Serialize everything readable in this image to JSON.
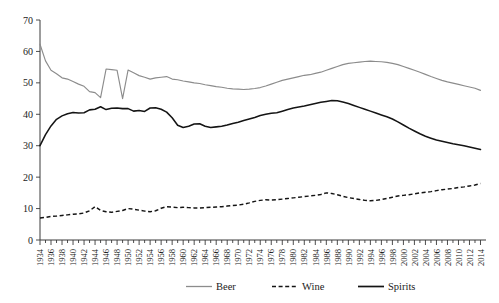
{
  "chart_data": {
    "type": "line",
    "title": "",
    "subtitle": "",
    "xlabel": "",
    "ylabel": "",
    "ylim": [
      0,
      70
    ],
    "xlim": [
      1934,
      2015
    ],
    "ytick_step": 10,
    "yticks": [
      0,
      10,
      20,
      30,
      40,
      50,
      60,
      70
    ],
    "grid": false,
    "legend_position": "bottom-center",
    "x": [
      1934,
      1935,
      1936,
      1937,
      1938,
      1939,
      1940,
      1941,
      1942,
      1943,
      1944,
      1945,
      1946,
      1947,
      1948,
      1949,
      1950,
      1951,
      1952,
      1953,
      1954,
      1955,
      1956,
      1957,
      1958,
      1959,
      1960,
      1961,
      1962,
      1963,
      1964,
      1965,
      1966,
      1967,
      1968,
      1969,
      1970,
      1971,
      1972,
      1973,
      1974,
      1975,
      1976,
      1977,
      1978,
      1979,
      1980,
      1981,
      1982,
      1983,
      1984,
      1985,
      1986,
      1987,
      1988,
      1989,
      1990,
      1991,
      1992,
      1993,
      1994,
      1995,
      1996,
      1997,
      1998,
      1999,
      2000,
      2001,
      2002,
      2003,
      2004,
      2005,
      2006,
      2007,
      2008,
      2009,
      2010,
      2011,
      2012,
      2013,
      2014
    ],
    "xticks": [
      1934,
      1936,
      1938,
      1940,
      1942,
      1944,
      1946,
      1948,
      1950,
      1952,
      1954,
      1956,
      1958,
      1960,
      1962,
      1964,
      1966,
      1968,
      1970,
      1972,
      1974,
      1976,
      1978,
      1980,
      1982,
      1984,
      1986,
      1988,
      1990,
      1992,
      1994,
      1996,
      1998,
      2000,
      2002,
      2004,
      2006,
      2008,
      2010,
      2012,
      2014
    ],
    "series": [
      {
        "name": "Beer",
        "color": "#8c8c8c",
        "style": "solid",
        "values": [
          62.3,
          57.0,
          54.0,
          52.9,
          51.6,
          51.2,
          50.4,
          49.6,
          48.9,
          47.2,
          46.9,
          45.3,
          54.4,
          54.2,
          54.0,
          45.0,
          54.1,
          53.2,
          52.3,
          51.8,
          51.2,
          51.6,
          51.8,
          52.0,
          51.2,
          51.0,
          50.6,
          50.3,
          50.0,
          49.8,
          49.4,
          49.1,
          48.8,
          48.6,
          48.3,
          48.1,
          48.0,
          47.9,
          48.0,
          48.2,
          48.5,
          49.0,
          49.6,
          50.2,
          50.8,
          51.2,
          51.6,
          52.0,
          52.4,
          52.6,
          53.0,
          53.4,
          54.0,
          54.6,
          55.2,
          55.8,
          56.2,
          56.4,
          56.6,
          56.8,
          56.9,
          56.8,
          56.7,
          56.5,
          56.2,
          55.8,
          55.2,
          54.6,
          54.0,
          53.4,
          52.7,
          52.0,
          51.4,
          50.8,
          50.3,
          49.9,
          49.5,
          49.1,
          48.7,
          48.3,
          47.6
        ]
      },
      {
        "name": "Wine",
        "color": "#141414",
        "style": "dashed",
        "values": [
          7.0,
          7.2,
          7.5,
          7.6,
          7.8,
          8.0,
          8.2,
          8.3,
          8.6,
          9.3,
          10.6,
          9.4,
          9.0,
          8.8,
          9.1,
          9.4,
          10.0,
          9.8,
          9.5,
          9.2,
          9.0,
          9.3,
          10.1,
          10.6,
          10.5,
          10.3,
          10.4,
          10.3,
          10.2,
          10.2,
          10.3,
          10.4,
          10.5,
          10.6,
          10.8,
          11.0,
          11.1,
          11.4,
          11.8,
          12.3,
          12.6,
          12.8,
          12.7,
          12.8,
          13.0,
          13.2,
          13.4,
          13.6,
          13.8,
          14.0,
          14.2,
          14.5,
          15.0,
          14.8,
          14.4,
          13.9,
          13.5,
          13.2,
          12.9,
          12.6,
          12.5,
          12.6,
          12.9,
          13.2,
          13.6,
          14.0,
          14.2,
          14.4,
          14.7,
          15.0,
          15.2,
          15.4,
          15.7,
          16.0,
          16.2,
          16.4,
          16.7,
          16.9,
          17.2,
          17.5,
          18.0
        ]
      },
      {
        "name": "Spirits",
        "color": "#141414",
        "style": "solid",
        "values": [
          30.0,
          33.5,
          36.3,
          38.4,
          39.5,
          40.2,
          40.6,
          40.4,
          40.5,
          41.4,
          41.6,
          42.4,
          41.5,
          41.9,
          42.0,
          41.8,
          41.8,
          41.0,
          41.2,
          40.9,
          42.0,
          42.1,
          41.6,
          40.7,
          38.9,
          36.5,
          35.8,
          36.2,
          36.9,
          37.0,
          36.2,
          35.8,
          36.0,
          36.2,
          36.6,
          37.1,
          37.5,
          38.0,
          38.5,
          39.0,
          39.6,
          40.0,
          40.3,
          40.5,
          41.0,
          41.5,
          42.0,
          42.3,
          42.6,
          43.0,
          43.4,
          43.8,
          44.1,
          44.4,
          44.3,
          43.9,
          43.4,
          42.8,
          42.2,
          41.6,
          41.0,
          40.4,
          39.8,
          39.2,
          38.5,
          37.6,
          36.6,
          35.6,
          34.7,
          33.8,
          33.0,
          32.4,
          31.8,
          31.4,
          31.0,
          30.6,
          30.3,
          30.0,
          29.6,
          29.2,
          28.8
        ]
      }
    ]
  },
  "legend": {
    "items": [
      {
        "label": "Beer",
        "style": "solid-gray"
      },
      {
        "label": "Wine",
        "style": "dashed-black"
      },
      {
        "label": "Spirits",
        "style": "solid-black"
      }
    ]
  }
}
